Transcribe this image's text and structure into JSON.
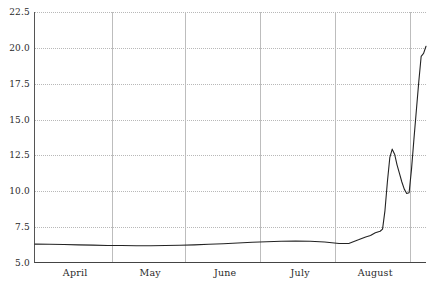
{
  "chart_data": {
    "type": "line",
    "title": "",
    "subtitle": "",
    "xlabel": "",
    "ylabel": "",
    "grid": true,
    "legend": "none",
    "xlim": [
      0,
      162
    ],
    "ylim": [
      5.0,
      22.5
    ],
    "y_ticks": [
      22.5,
      20.0,
      17.5,
      15.0,
      12.5,
      10.0,
      7.5,
      5.0
    ],
    "y_tick_labels": [
      "22.5",
      "20.0",
      "17.5",
      "15.0",
      "12.5",
      "10.0",
      "7.5",
      "5.0"
    ],
    "x_tick_labels": [
      "April",
      "May",
      "June",
      "July",
      "August"
    ],
    "x_tick_positions": [
      17,
      48,
      79,
      110,
      141
    ],
    "x_gridline_positions": [
      32,
      62,
      93,
      124,
      155
    ],
    "series": [
      {
        "name": "value",
        "x": [
          0,
          6,
          12,
          18,
          24,
          30,
          36,
          42,
          48,
          54,
          60,
          66,
          72,
          78,
          84,
          90,
          96,
          102,
          108,
          114,
          120,
          126,
          130,
          134,
          137,
          139,
          141,
          143,
          144,
          145,
          146,
          147,
          148,
          149,
          150,
          151,
          152,
          153,
          154,
          155,
          156,
          157,
          158,
          159,
          160,
          161,
          162
        ],
        "y": [
          6.25,
          6.24,
          6.22,
          6.2,
          6.18,
          6.16,
          6.15,
          6.14,
          6.14,
          6.15,
          6.17,
          6.2,
          6.24,
          6.28,
          6.33,
          6.38,
          6.42,
          6.45,
          6.46,
          6.45,
          6.4,
          6.3,
          6.3,
          6.55,
          6.75,
          6.85,
          7.05,
          7.15,
          7.3,
          8.6,
          10.6,
          12.3,
          12.9,
          12.55,
          11.8,
          11.2,
          10.6,
          10.1,
          9.8,
          9.85,
          11.5,
          13.6,
          15.6,
          17.6,
          19.4,
          19.6,
          20.1
        ]
      }
    ]
  },
  "axes": {
    "y_axis_name": "y-axis",
    "x_axis_name": "x-axis"
  }
}
